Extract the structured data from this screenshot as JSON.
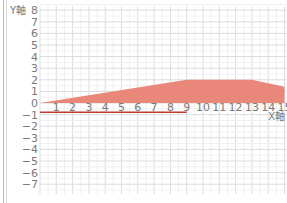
{
  "chart_data": {
    "type": "area",
    "title": "",
    "xlabel": "X軸",
    "ylabel": "Y軸",
    "xlim": [
      0,
      15
    ],
    "ylim": [
      -7,
      8
    ],
    "x_ticks": [
      "0",
      "1",
      "2",
      "3",
      "4",
      "5",
      "6",
      "7",
      "8",
      "9",
      "10",
      "11",
      "12",
      "13",
      "14",
      "15"
    ],
    "y_ticks": [
      "8",
      "7",
      "6",
      "5",
      "4",
      "3",
      "2",
      "1",
      "0",
      "−1",
      "−2",
      "−3",
      "−4",
      "−5",
      "−6",
      "−7"
    ],
    "grid": true,
    "series": [
      {
        "name": "area",
        "type": "area",
        "color": "#e8877a",
        "points": [
          [
            0,
            0
          ],
          [
            9,
            2
          ],
          [
            13,
            2
          ],
          [
            15,
            1.4
          ]
        ]
      },
      {
        "name": "line",
        "type": "line",
        "color": "#c0392b",
        "points": [
          [
            0,
            -0.8
          ],
          [
            9,
            -0.8
          ]
        ]
      }
    ]
  },
  "axes": {
    "y_label": "Y軸",
    "x_label": "X軸"
  }
}
